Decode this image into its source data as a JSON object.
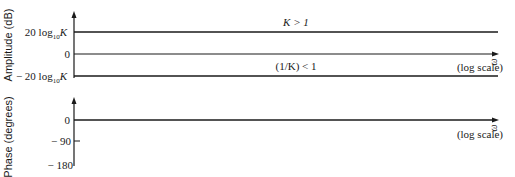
{
  "amplitude_plot": {
    "ylabel": "Amplitude (dB)",
    "ticks": {
      "pos": "20 log",
      "pos_sub": "10",
      "pos_var": "K",
      "zero": "0",
      "neg": "− 20 log",
      "neg_sub": "10",
      "neg_var": "K"
    },
    "upper_line_label": "K > 1",
    "lower_line_label": "(1/K) < 1",
    "xaxis_var": "ω",
    "xaxis_note": "(log scale)"
  },
  "phase_plot": {
    "ylabel": "Phase (degrees)",
    "ticks": [
      "0",
      "− 90",
      "− 180"
    ],
    "xaxis_var": "ω",
    "xaxis_note": "(log scale)"
  },
  "colors": {
    "ink": "#1a1a1a",
    "background": "#ffffff"
  }
}
